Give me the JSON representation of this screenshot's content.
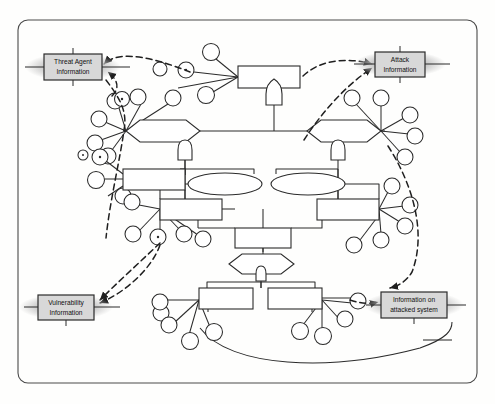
{
  "diagram": {
    "type": "attack-tree",
    "frame": {
      "shape": "rounded-rectangle",
      "stroke": "#4a4a4a",
      "fill": "#fefefd"
    },
    "style": {
      "line_color": "#2b2b2b",
      "dashed_color": "#1f1f1f",
      "node_fill": "#ffffff",
      "label_box_fill": "#d8d8d8",
      "label_box_stroke": "#2b2b2b",
      "halo_fill": "#c9c9c9",
      "text_color": "#101010"
    },
    "labels": {
      "threat_agent": "Threat Agent\nInformation",
      "threat_agent_line1": "Threat Agent",
      "threat_agent_line2": "Information",
      "attack_info_line1": "Attack",
      "attack_info_line2": "Information",
      "vulnerability_line1": "Vulnerability",
      "vulnerability_line2": "Information",
      "attacked_system_line1": "Information on",
      "attacked_system_line2": "attacked system"
    },
    "label_boxes": [
      {
        "id": "threat-agent-information",
        "line1": "Threat Agent",
        "line2": "Information",
        "x": 44,
        "y": 54,
        "w": 58,
        "h": 26,
        "corner": "top-left"
      },
      {
        "id": "attack-information",
        "line1": "Attack",
        "line2": "Information",
        "x": 375,
        "y": 52,
        "w": 50,
        "h": 25,
        "corner": "top-right"
      },
      {
        "id": "vulnerability-information",
        "line1": "Vulnerability",
        "line2": "Information",
        "x": 38,
        "y": 295,
        "w": 56,
        "h": 25,
        "corner": "bottom-left"
      },
      {
        "id": "information-on-attacked-system",
        "line1": "Information on",
        "line2": "attacked system",
        "x": 381,
        "y": 292,
        "w": 66,
        "h": 26,
        "corner": "bottom-right"
      }
    ],
    "gate_nodes": [
      {
        "id": "or-gate-top",
        "shape": "or-gate",
        "x": 274,
        "y": 86
      },
      {
        "id": "and-gate-left",
        "shape": "and-gate",
        "x": 185,
        "y": 146
      },
      {
        "id": "and-gate-right",
        "shape": "and-gate",
        "x": 338,
        "y": 146
      },
      {
        "id": "and-gate-bottom",
        "shape": "and-gate",
        "x": 261,
        "y": 267
      }
    ],
    "hexagon_nodes": [
      {
        "id": "hexagon-left",
        "x": 126,
        "y": 120,
        "w": 74,
        "h": 22
      },
      {
        "id": "hexagon-right",
        "x": 307,
        "y": 120,
        "w": 74,
        "h": 22
      },
      {
        "id": "hexagon-bottom",
        "x": 229,
        "y": 254,
        "w": 64,
        "h": 20
      }
    ],
    "ellipse_nodes": [
      {
        "id": "ellipse-left",
        "cx": 225,
        "cy": 184,
        "rx": 37,
        "ry": 11
      },
      {
        "id": "ellipse-right",
        "cx": 308,
        "cy": 184,
        "rx": 37,
        "ry": 11
      }
    ],
    "box_nodes": [
      {
        "id": "box-top-center",
        "x": 238,
        "y": 66,
        "w": 62,
        "h": 22
      },
      {
        "id": "box-left-upper",
        "x": 123,
        "y": 169,
        "w": 62,
        "h": 21
      },
      {
        "id": "box-left-lower",
        "x": 160,
        "y": 199,
        "w": 62,
        "h": 21
      },
      {
        "id": "box-right-lower",
        "x": 317,
        "y": 199,
        "w": 62,
        "h": 21
      },
      {
        "id": "box-mid-center",
        "x": 235,
        "y": 228,
        "w": 56,
        "h": 20
      },
      {
        "id": "box-bottom-left",
        "x": 199,
        "y": 288,
        "w": 54,
        "h": 21
      },
      {
        "id": "box-bottom-right",
        "x": 268,
        "y": 288,
        "w": 54,
        "h": 21
      }
    ],
    "leaf_counts": {
      "top_left_cluster": 6,
      "top_right_cluster": 6,
      "left_mid_cluster": 6,
      "right_mid_cluster": 5,
      "bottom_left_cluster": 5,
      "bottom_right_cluster": 4
    },
    "connector_types": {
      "solid": "structural tree edge",
      "dashed": "information flow to label box",
      "arrowhead": "directed flow"
    }
  }
}
